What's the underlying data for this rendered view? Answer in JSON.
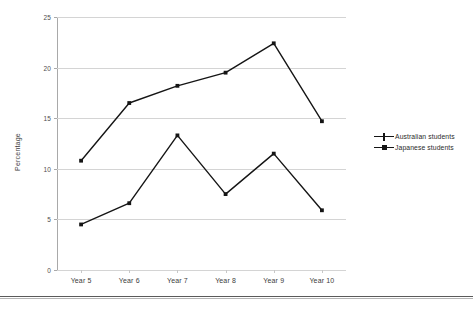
{
  "chart_data": {
    "type": "line",
    "title": "",
    "xlabel": "",
    "ylabel": "Percentage",
    "categories": [
      "Year 5",
      "Year 6",
      "Year 7",
      "Year 8",
      "Year 9",
      "Year 10"
    ],
    "series": [
      {
        "name": "Australian students",
        "marker": "cross",
        "color": "#151515",
        "values": [
          10.8,
          16.5,
          18.2,
          19.5,
          22.4,
          14.7
        ]
      },
      {
        "name": "Japanese students",
        "marker": "square",
        "color": "#151515",
        "values": [
          4.5,
          6.6,
          13.3,
          7.5,
          11.5,
          5.9
        ]
      }
    ],
    "ylim": [
      0,
      25
    ],
    "yticks": [
      0,
      5,
      10,
      15,
      20,
      25
    ],
    "ytick_labels": [
      "0",
      "5",
      "10",
      "15",
      "20",
      "25"
    ],
    "grid": "horizontal",
    "grid_color": "#d4d4d4",
    "legend_position": "right"
  }
}
